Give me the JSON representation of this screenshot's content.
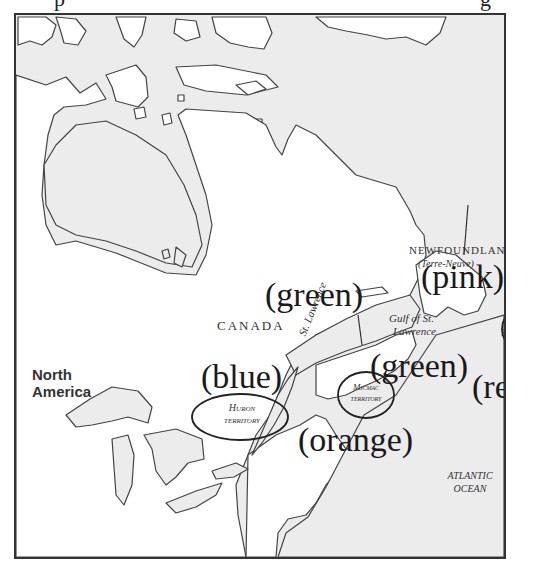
{
  "title_fragment": {
    "visible_glyphs": [
      "p",
      "g"
    ]
  },
  "map": {
    "region": "Eastern Canada and northeastern North America",
    "colors": {
      "water": "#ececec",
      "land": "#ffffff",
      "coast": "#444444",
      "frame": "#333333",
      "annotation_text": "#1a1a1a"
    },
    "place_labels": {
      "newfoundland": "NEWFOUNDLAND",
      "newfoundland_alt": "(Terre-Neuve)",
      "canada": "CANADA",
      "north_america_line1": "North",
      "north_america_line2": "America",
      "gulf_line1": "Gulf of St.",
      "gulf_line2": "Lawrence",
      "st_lawrence": "St. Lawrence",
      "st_johns": "St. John's",
      "huron_line1": "Huron",
      "huron_line2": "territory",
      "micmac_line1": "Micmac",
      "micmac_line2": "territory",
      "atlantic_line1": "ATLANTIC",
      "atlantic_line2": "OCEAN"
    },
    "color_annotations": {
      "pink": "(pink)",
      "green_top": "(green)",
      "green_gulf": "(green)",
      "blue": "(blue)",
      "orange": "(orange)",
      "red": "(red)"
    }
  }
}
